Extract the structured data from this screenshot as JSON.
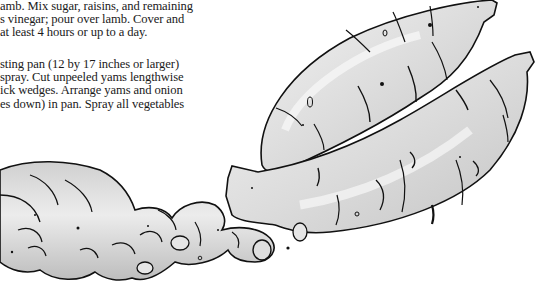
{
  "page": {
    "type": "recipe-excerpt",
    "paragraphs": [
      {
        "id": "marinate",
        "lines": [
          "amb. Mix sugar, raisins, and remaining",
          "s vinegar; pour over lamb. Cover and",
          "at least 4 hours or up to a day."
        ]
      },
      {
        "id": "roast",
        "lines": [
          "sting pan (12 by 17 inches or larger)",
          "spray. Cut unpeeled yams lengthwise",
          "ick wedges. Arrange yams and onion",
          "es down) in pan. Spray all vegetables"
        ]
      }
    ]
  },
  "illustration": {
    "subject": "yams and ginger root",
    "style": "grayscale ink sketch",
    "colors": {
      "outline": "#111111",
      "fill_light": "#e8e8e8",
      "fill_mid": "#cfcfcf",
      "fill_dark": "#b4b4b4",
      "highlight": "#f7f7f7"
    }
  }
}
